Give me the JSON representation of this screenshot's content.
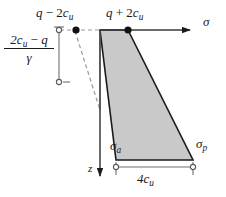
{
  "figure": {
    "background_color": "#ffffff",
    "line_color": "#1a1a1a",
    "fill_color": "#c9c9c9",
    "dashed_color": "#9a9a9a"
  },
  "labels": {
    "top_left_pressure": {
      "full": "q − 2cᵤ",
      "lead": "q",
      "operator": " − 2",
      "symbol": "c",
      "subscript": "u"
    },
    "top_right_pressure": {
      "full": "q + 2cᵤ",
      "lead": "q",
      "operator": " + 2",
      "symbol": "c",
      "subscript": "u"
    },
    "horizontal_axis": "σ",
    "vertical_axis": "z",
    "active_pressure": {
      "symbol": "σ",
      "subscript": "a"
    },
    "passive_pressure": {
      "symbol": "σ",
      "subscript": "p"
    },
    "depth_fraction": {
      "numerator_lead": "2",
      "numerator_symbol": "c",
      "numerator_subscript": "u",
      "numerator_operator": " − ",
      "numerator_tail": "q",
      "denominator": "γ",
      "full": "(2cᵤ − q) / γ"
    },
    "width_dimension": {
      "lead": "4",
      "symbol": "c",
      "subscript": "u",
      "full": "4cᵤ"
    }
  },
  "geometry": {
    "sigma_axis": {
      "x1": 100,
      "y1": 30,
      "x2": 192,
      "y2": 30
    },
    "z_axis": {
      "x1": 100,
      "y1": 30,
      "x2": 100,
      "y2": 178
    },
    "polygon_points": "100,30 128,30 193,160 116,160",
    "polygon_left_break": {
      "x": 100,
      "y": 110
    },
    "dashed_line": {
      "x1": 74,
      "y1": 30,
      "x2": 100,
      "y2": 110
    },
    "depth_dimension_line": {
      "x": 59,
      "y1": 30,
      "y2": 82
    },
    "width_dimension_line": {
      "y": 167,
      "x1": 116,
      "x2": 193
    },
    "filled_markers": [
      {
        "x": 76,
        "y": 30
      },
      {
        "x": 128,
        "y": 30
      }
    ],
    "open_markers": [
      {
        "x": 59,
        "y": 30
      },
      {
        "x": 59,
        "y": 82
      },
      {
        "x": 116,
        "y": 167
      },
      {
        "x": 193,
        "y": 167
      }
    ]
  }
}
